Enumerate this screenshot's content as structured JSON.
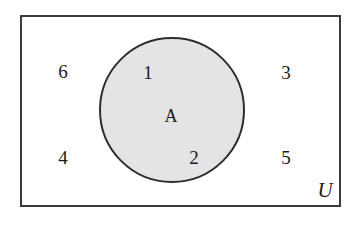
{
  "diagram": {
    "type": "venn",
    "universe": {
      "name": "U",
      "label": "U",
      "border_color": "#3b3b3b",
      "fill_color": "#ffffff"
    },
    "sets": [
      {
        "name": "A",
        "label": "A",
        "fill_color": "#e4e4e4",
        "border_color": "#2e2e2e"
      }
    ],
    "elements": [
      {
        "label": "6",
        "region": "outside-A",
        "x": 63,
        "y": 71
      },
      {
        "label": "1",
        "region": "inside-A",
        "x": 148,
        "y": 72
      },
      {
        "label": "3",
        "region": "outside-A",
        "x": 286,
        "y": 72
      },
      {
        "label": "A",
        "region": "set-name",
        "x": 171,
        "y": 116
      },
      {
        "label": "4",
        "region": "outside-A",
        "x": 63,
        "y": 157
      },
      {
        "label": "2",
        "region": "inside-A",
        "x": 194,
        "y": 157
      },
      {
        "label": "5",
        "region": "outside-A",
        "x": 286,
        "y": 157
      },
      {
        "label": "U",
        "region": "universe-name",
        "x": 325,
        "y": 190
      }
    ]
  }
}
